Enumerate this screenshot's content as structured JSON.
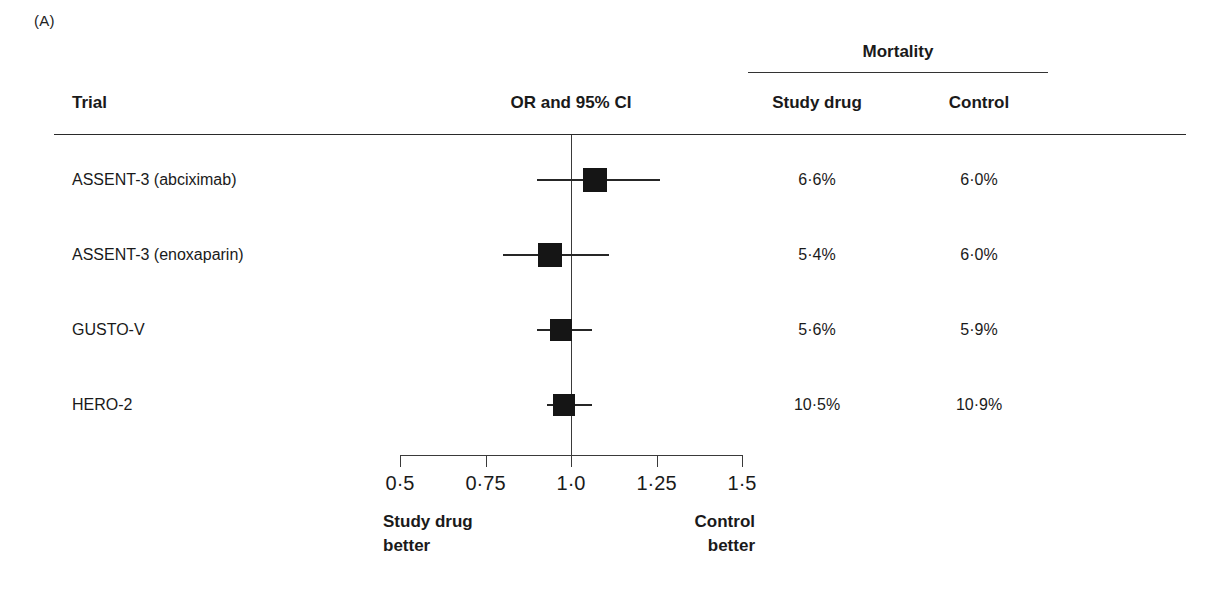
{
  "panel": {
    "label": "(A)"
  },
  "header": {
    "group_title": "Mortality",
    "trial": "Trial",
    "or_ci": "OR and 95% CI",
    "study_drug": "Study drug",
    "control": "Control"
  },
  "footer": {
    "left_line1": "Study drug",
    "left_line2": "better",
    "right_line1": "Control",
    "right_line2": "better"
  },
  "chart_data": {
    "type": "scatter",
    "title": "OR and 95% CI",
    "subtitle": "Mortality",
    "xlabel": "Odds ratio",
    "ylabel": "Trial",
    "xlim": [
      0.5,
      1.5
    ],
    "xscale": "linear",
    "grid": false,
    "legend": "none",
    "reference_line": 1.0,
    "tick_values": [
      0.5,
      0.75,
      1.0,
      1.25,
      1.5
    ],
    "tick_labels": [
      "0·5",
      "0·75",
      "1·0",
      "1·25",
      "1·5"
    ],
    "left_annotation": "Study drug better",
    "right_annotation": "Control better",
    "columns": [
      "Trial",
      "OR and 95% CI",
      "Study drug",
      "Control"
    ],
    "rows": [
      {
        "trial": "ASSENT-3 (abciximab)",
        "or": 1.07,
        "ci_low": 0.9,
        "ci_high": 1.26,
        "box_size": 24,
        "study_drug": "6·6%",
        "control": "6·0%"
      },
      {
        "trial": "ASSENT-3 (enoxaparin)",
        "or": 0.94,
        "ci_low": 0.8,
        "ci_high": 1.11,
        "box_size": 24,
        "study_drug": "5·4%",
        "control": "6·0%"
      },
      {
        "trial": "GUSTO-V",
        "or": 0.97,
        "ci_low": 0.9,
        "ci_high": 1.06,
        "box_size": 22,
        "study_drug": "5·6%",
        "control": "5·9%"
      },
      {
        "trial": "HERO-2",
        "or": 0.98,
        "ci_low": 0.93,
        "ci_high": 1.06,
        "box_size": 22,
        "study_drug": "10·5%",
        "control": "10·9%"
      }
    ]
  },
  "colors": {
    "marker": "#151515",
    "rule": "#2a2a2a",
    "text": "#1a1a1a"
  }
}
